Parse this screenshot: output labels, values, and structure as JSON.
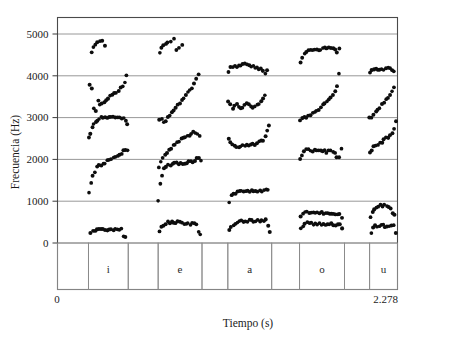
{
  "figure": {
    "title": "",
    "background": "#ffffff",
    "ink": "#0d0d0d"
  },
  "axes": {
    "y_title": "Frecuencia (Hz)",
    "x_title": "Tiempo (s)",
    "y_ticks": [
      "0",
      "1000",
      "2000",
      "3000",
      "4000",
      "5000"
    ],
    "x_ticks": [
      "0",
      "2.278"
    ]
  },
  "segments": {
    "labels": [
      "i",
      "e",
      "a",
      "o",
      "u"
    ]
  },
  "chart_data": {
    "type": "scatter",
    "title": "",
    "xlabel": "Tiempo (s)",
    "ylabel": "Frecuencia (Hz)",
    "xlim": [
      0,
      2.278
    ],
    "ylim": [
      0,
      5500
    ],
    "grid": true,
    "legend": false,
    "ytick_values": [
      0,
      1000,
      2000,
      3000,
      4000,
      5000
    ],
    "xtick_values": [
      0,
      2.278
    ],
    "marker": "filled-circle",
    "marker_size_px": 2.6,
    "segment_boxes": [
      {
        "label": "",
        "x_start": 0.0,
        "x_end": 0.091
      },
      {
        "label": "i",
        "x_start": 0.091,
        "x_end": 0.208
      },
      {
        "label": "",
        "x_start": 0.208,
        "x_end": 0.296
      },
      {
        "label": "e",
        "x_start": 0.296,
        "x_end": 0.425
      },
      {
        "label": "",
        "x_start": 0.425,
        "x_end": 0.501
      },
      {
        "label": "a",
        "x_start": 0.501,
        "x_end": 0.63
      },
      {
        "label": "",
        "x_start": 0.63,
        "x_end": 0.712
      },
      {
        "label": "o",
        "x_start": 0.712,
        "x_end": 0.844
      },
      {
        "label": "",
        "x_start": 0.844,
        "x_end": 0.918
      },
      {
        "label": "u",
        "x_start": 0.918,
        "x_end": 1.0
      }
    ],
    "series": [
      {
        "name": "i-F1",
        "vowel": "i",
        "formant": 1,
        "x": [
          0.098,
          0.104,
          0.11,
          0.116,
          0.122,
          0.128,
          0.134,
          0.14,
          0.146,
          0.152,
          0.158,
          0.164,
          0.17,
          0.176,
          0.182,
          0.188,
          0.194,
          0.2
        ],
        "y": [
          250,
          285,
          300,
          310,
          312,
          315,
          316,
          318,
          318,
          316,
          315,
          315,
          316,
          318,
          320,
          330,
          150,
          120
        ]
      },
      {
        "name": "i-F2",
        "vowel": "i",
        "formant": 2,
        "x": [
          0.092,
          0.098,
          0.104,
          0.11,
          0.116,
          0.122,
          0.128,
          0.134,
          0.14,
          0.146,
          0.152,
          0.158,
          0.164,
          0.17,
          0.176,
          0.182,
          0.188,
          0.194,
          0.2,
          0.205
        ],
        "y": [
          1180,
          1430,
          1600,
          1720,
          1800,
          1840,
          1870,
          1900,
          1930,
          1960,
          1990,
          2010,
          2040,
          2070,
          2100,
          2130,
          2160,
          2190,
          2210,
          2220
        ]
      },
      {
        "name": "i-F3",
        "vowel": "i",
        "formant": 3,
        "x": [
          0.092,
          0.097,
          0.102,
          0.107,
          0.112,
          0.117,
          0.122,
          0.128,
          0.134,
          0.14,
          0.146,
          0.152,
          0.158,
          0.164,
          0.17,
          0.176,
          0.182,
          0.188,
          0.194,
          0.2,
          0.205
        ],
        "y": [
          2500,
          2600,
          2750,
          2860,
          2900,
          2950,
          2980,
          3000,
          3010,
          3010,
          3000,
          3000,
          3010,
          3010,
          3020,
          3020,
          3010,
          3000,
          2990,
          2950,
          2870
        ]
      },
      {
        "name": "i-F4",
        "vowel": "i",
        "formant": 4,
        "x": [
          0.095,
          0.101,
          0.107,
          0.113,
          0.119,
          0.125,
          0.131,
          0.137,
          0.143,
          0.149,
          0.155,
          0.161,
          0.167,
          0.173,
          0.179,
          0.185,
          0.191,
          0.197,
          0.203
        ],
        "y": [
          3780,
          3720,
          3250,
          3160,
          3420,
          3300,
          3360,
          3350,
          3400,
          3450,
          3500,
          3530,
          3560,
          3600,
          3640,
          3700,
          3750,
          3850,
          4040
        ]
      },
      {
        "name": "i-F5",
        "vowel": "i",
        "formant": 5,
        "x": [
          0.1,
          0.106,
          0.112,
          0.118,
          0.124,
          0.132,
          0.14
        ],
        "y": [
          4560,
          4680,
          4760,
          4800,
          4820,
          4860,
          4700
        ]
      },
      {
        "name": "e-F1",
        "vowel": "e",
        "formant": 1,
        "x": [
          0.3,
          0.306,
          0.312,
          0.318,
          0.324,
          0.33,
          0.336,
          0.342,
          0.348,
          0.354,
          0.36,
          0.366,
          0.372,
          0.378,
          0.384,
          0.39,
          0.396,
          0.402,
          0.408,
          0.414,
          0.42
        ],
        "y": [
          260,
          370,
          440,
          470,
          490,
          500,
          505,
          505,
          500,
          495,
          490,
          485,
          480,
          475,
          470,
          465,
          460,
          450,
          440,
          260,
          210
        ]
      },
      {
        "name": "e-F2",
        "vowel": "e",
        "formant": 2,
        "x": [
          0.296,
          0.302,
          0.308,
          0.314,
          0.32,
          0.326,
          0.332,
          0.338,
          0.344,
          0.35,
          0.356,
          0.362,
          0.368,
          0.374,
          0.38,
          0.386,
          0.392,
          0.398,
          0.404,
          0.41,
          0.416,
          0.422
        ],
        "y": [
          1040,
          1400,
          1640,
          1780,
          1830,
          1860,
          1880,
          1890,
          1895,
          1900,
          1905,
          1910,
          1915,
          1920,
          1930,
          1940,
          1950,
          1960,
          1980,
          2010,
          2050,
          1980
        ]
      },
      {
        "name": "e-F3",
        "vowel": "e",
        "formant": 3,
        "x": [
          0.298,
          0.304,
          0.31,
          0.316,
          0.322,
          0.328,
          0.334,
          0.34,
          0.346,
          0.352,
          0.358,
          0.364,
          0.37,
          0.376,
          0.382,
          0.388,
          0.394,
          0.4,
          0.406,
          0.412,
          0.418
        ],
        "y": [
          1780,
          1950,
          2060,
          2120,
          2170,
          2220,
          2270,
          2320,
          2360,
          2400,
          2440,
          2470,
          2500,
          2530,
          2560,
          2590,
          2620,
          2640,
          2660,
          2630,
          2560
        ]
      },
      {
        "name": "e-F4",
        "vowel": "e",
        "formant": 4,
        "x": [
          0.3,
          0.306,
          0.312,
          0.318,
          0.324,
          0.33,
          0.336,
          0.342,
          0.348,
          0.354,
          0.36,
          0.366,
          0.372,
          0.378,
          0.384,
          0.39,
          0.396,
          0.402,
          0.408,
          0.414
        ],
        "y": [
          2950,
          2960,
          2910,
          2940,
          3000,
          3060,
          3120,
          3180,
          3240,
          3300,
          3360,
          3420,
          3480,
          3540,
          3600,
          3660,
          3720,
          3790,
          3900,
          4030
        ]
      },
      {
        "name": "e-F5",
        "vowel": "e",
        "formant": 5,
        "x": [
          0.3,
          0.306,
          0.312,
          0.318,
          0.324,
          0.332,
          0.342,
          0.35,
          0.358,
          0.366
        ],
        "y": [
          4520,
          4650,
          4720,
          4760,
          4800,
          4840,
          4870,
          4620,
          4700,
          4750
        ]
      },
      {
        "name": "a-F1",
        "vowel": "a",
        "formant": 1,
        "x": [
          0.505,
          0.511,
          0.517,
          0.523,
          0.529,
          0.535,
          0.541,
          0.547,
          0.553,
          0.559,
          0.565,
          0.571,
          0.577,
          0.583,
          0.589,
          0.595,
          0.601,
          0.607,
          0.613,
          0.619,
          0.625
        ],
        "y": [
          300,
          400,
          450,
          480,
          500,
          510,
          515,
          520,
          522,
          524,
          525,
          526,
          527,
          528,
          530,
          532,
          534,
          536,
          538,
          400,
          270
        ]
      },
      {
        "name": "a-F2",
        "vowel": "a",
        "formant": 2,
        "x": [
          0.505,
          0.511,
          0.517,
          0.523,
          0.529,
          0.535,
          0.541,
          0.547,
          0.553,
          0.559,
          0.565,
          0.571,
          0.577,
          0.583,
          0.589,
          0.595,
          0.601,
          0.607,
          0.613,
          0.619
        ],
        "y": [
          980,
          1130,
          1180,
          1200,
          1210,
          1215,
          1220,
          1225,
          1228,
          1230,
          1232,
          1234,
          1236,
          1240,
          1245,
          1250,
          1255,
          1260,
          1270,
          1290
        ]
      },
      {
        "name": "a-F3",
        "vowel": "a",
        "formant": 3,
        "x": [
          0.503,
          0.509,
          0.515,
          0.521,
          0.527,
          0.533,
          0.539,
          0.545,
          0.551,
          0.557,
          0.563,
          0.569,
          0.575,
          0.581,
          0.587,
          0.593,
          0.599,
          0.605,
          0.611,
          0.617,
          0.623
        ],
        "y": [
          2500,
          2420,
          2360,
          2330,
          2320,
          2320,
          2325,
          2330,
          2335,
          2340,
          2345,
          2350,
          2360,
          2370,
          2380,
          2400,
          2430,
          2470,
          2560,
          2680,
          2810
        ]
      },
      {
        "name": "a-F4",
        "vowel": "a",
        "formant": 4,
        "x": [
          0.503,
          0.509,
          0.515,
          0.521,
          0.527,
          0.533,
          0.539,
          0.545,
          0.551,
          0.557,
          0.563,
          0.569,
          0.575,
          0.581,
          0.587,
          0.593,
          0.599,
          0.605,
          0.611
        ],
        "y": [
          3380,
          3300,
          3220,
          3260,
          3310,
          3290,
          3230,
          3250,
          3300,
          3340,
          3290,
          3260,
          3240,
          3270,
          3300,
          3350,
          3400,
          3460,
          3520
        ]
      },
      {
        "name": "a-F5",
        "vowel": "a",
        "formant": 5,
        "x": [
          0.503,
          0.509,
          0.515,
          0.521,
          0.527,
          0.533,
          0.539,
          0.545,
          0.551,
          0.557,
          0.563,
          0.569,
          0.575,
          0.581,
          0.587,
          0.593,
          0.599,
          0.605,
          0.611,
          0.617
        ],
        "y": [
          4110,
          4180,
          4200,
          4210,
          4215,
          4220,
          4230,
          4260,
          4290,
          4270,
          4240,
          4220,
          4210,
          4200,
          4190,
          4180,
          4150,
          4100,
          4040,
          4140
        ]
      },
      {
        "name": "o-F1",
        "vowel": "o",
        "formant": 1,
        "x": [
          0.716,
          0.722,
          0.728,
          0.734,
          0.74,
          0.746,
          0.752,
          0.758,
          0.764,
          0.77,
          0.776,
          0.782,
          0.788,
          0.794,
          0.8,
          0.806,
          0.812,
          0.818,
          0.824,
          0.83,
          0.836
        ],
        "y": [
          330,
          420,
          460,
          470,
          470,
          468,
          465,
          462,
          460,
          458,
          455,
          452,
          450,
          448,
          445,
          442,
          438,
          434,
          430,
          420,
          330
        ]
      },
      {
        "name": "o-F2",
        "vowel": "o",
        "formant": 2,
        "x": [
          0.716,
          0.722,
          0.728,
          0.734,
          0.74,
          0.746,
          0.752,
          0.758,
          0.764,
          0.77,
          0.776,
          0.782,
          0.788,
          0.794,
          0.8,
          0.806,
          0.812,
          0.818,
          0.824,
          0.83,
          0.836
        ],
        "y": [
          640,
          700,
          720,
          725,
          726,
          727,
          727,
          727,
          726,
          725,
          723,
          721,
          718,
          715,
          712,
          709,
          704,
          698,
          690,
          680,
          630
        ]
      },
      {
        "name": "o-F3",
        "vowel": "o",
        "formant": 3,
        "x": [
          0.714,
          0.72,
          0.726,
          0.732,
          0.738,
          0.744,
          0.75,
          0.756,
          0.762,
          0.768,
          0.774,
          0.78,
          0.786,
          0.792,
          0.798,
          0.804,
          0.81,
          0.816,
          0.822,
          0.828,
          0.834
        ],
        "y": [
          2000,
          2120,
          2200,
          2230,
          2240,
          2220,
          2200,
          2210,
          2230,
          2240,
          2220,
          2200,
          2190,
          2180,
          2185,
          2190,
          2180,
          2170,
          2080,
          2050,
          2280
        ]
      },
      {
        "name": "o-F4",
        "vowel": "o",
        "formant": 4,
        "x": [
          0.714,
          0.72,
          0.726,
          0.732,
          0.738,
          0.744,
          0.75,
          0.756,
          0.762,
          0.768,
          0.774,
          0.78,
          0.786,
          0.792,
          0.798,
          0.804,
          0.81,
          0.816,
          0.822,
          0.828
        ],
        "y": [
          2950,
          2970,
          2990,
          3010,
          3040,
          3070,
          3100,
          3130,
          3160,
          3200,
          3240,
          3290,
          3340,
          3390,
          3440,
          3500,
          3570,
          3650,
          3760,
          4040
        ]
      },
      {
        "name": "o-F5",
        "vowel": "o",
        "formant": 5,
        "x": [
          0.714,
          0.72,
          0.726,
          0.732,
          0.738,
          0.744,
          0.75,
          0.756,
          0.762,
          0.768,
          0.774,
          0.78,
          0.786,
          0.792,
          0.798,
          0.804,
          0.81,
          0.816,
          0.822,
          0.828
        ],
        "y": [
          4350,
          4460,
          4540,
          4570,
          4590,
          4600,
          4610,
          4615,
          4620,
          4625,
          4630,
          4640,
          4650,
          4660,
          4670,
          4670,
          4640,
          4600,
          4570,
          4650
        ]
      },
      {
        "name": "u-F1",
        "vowel": "u",
        "formant": 1,
        "x": [
          0.922,
          0.928,
          0.934,
          0.94,
          0.946,
          0.952,
          0.958,
          0.964,
          0.97,
          0.976,
          0.982,
          0.988,
          0.994
        ],
        "y": [
          240,
          350,
          400,
          410,
          412,
          412,
          410,
          408,
          406,
          404,
          402,
          400,
          240
        ]
      },
      {
        "name": "u-F2",
        "vowel": "u",
        "formant": 2,
        "x": [
          0.92,
          0.926,
          0.932,
          0.938,
          0.944,
          0.95,
          0.956,
          0.962,
          0.968,
          0.974,
          0.98,
          0.986,
          0.992
        ],
        "y": [
          640,
          760,
          830,
          870,
          890,
          900,
          900,
          890,
          870,
          840,
          800,
          740,
          660
        ]
      },
      {
        "name": "u-F3",
        "vowel": "u",
        "formant": 3,
        "x": [
          0.918,
          0.924,
          0.93,
          0.936,
          0.942,
          0.948,
          0.954,
          0.96,
          0.966,
          0.972,
          0.978,
          0.984,
          0.99,
          0.996
        ],
        "y": [
          2150,
          2230,
          2290,
          2330,
          2360,
          2390,
          2420,
          2460,
          2500,
          2540,
          2590,
          2650,
          2760,
          2900
        ]
      },
      {
        "name": "u-F4",
        "vowel": "u",
        "formant": 4,
        "x": [
          0.918,
          0.924,
          0.93,
          0.936,
          0.942,
          0.948,
          0.954,
          0.96,
          0.966,
          0.972,
          0.978,
          0.984,
          0.99
        ],
        "y": [
          2980,
          3020,
          3070,
          3120,
          3180,
          3240,
          3300,
          3360,
          3420,
          3480,
          3540,
          3610,
          3700
        ]
      },
      {
        "name": "u-F5",
        "vowel": "u",
        "formant": 5,
        "x": [
          0.918,
          0.924,
          0.93,
          0.936,
          0.942,
          0.948,
          0.954,
          0.96,
          0.966,
          0.972,
          0.978,
          0.984,
          0.99
        ],
        "y": [
          4080,
          4140,
          4160,
          4150,
          4140,
          4150,
          4160,
          4165,
          4170,
          4175,
          4170,
          4160,
          4120
        ]
      }
    ]
  }
}
